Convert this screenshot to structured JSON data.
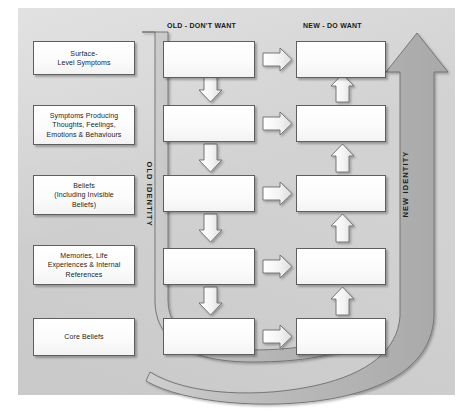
{
  "diagram": {
    "panel_color": "#d2d2d2",
    "box_fill": "#fdfdfd",
    "ribbon_fill": "#bdbdbd",
    "ink": "#1d1d1d"
  },
  "columns": {
    "layers_header": "",
    "old_header": "OLD - DON'T WANT",
    "new_header": "NEW - DO WANT"
  },
  "ribbons": {
    "old_label": "OLD IDENTITY",
    "new_label": "NEW IDENTITY"
  },
  "layers": [
    {
      "label": "Surface-\nLevel Symptoms"
    },
    {
      "label": "Symptoms Producing\nThoughts, Feelings,\nEmotions & Behaviours"
    },
    {
      "label": "Beliefs\n(Including Invisible\nBeliefs)"
    },
    {
      "label": "Memories, Life\nExperiences & Internal\nReferences"
    },
    {
      "label": "Core Beliefs"
    }
  ],
  "old_boxes": [
    {
      "label": ""
    },
    {
      "label": ""
    },
    {
      "label": ""
    },
    {
      "label": ""
    },
    {
      "label": ""
    }
  ],
  "new_boxes": [
    {
      "label": ""
    },
    {
      "label": ""
    },
    {
      "label": ""
    },
    {
      "label": ""
    },
    {
      "label": ""
    }
  ],
  "connectors": {
    "old_down_arrows": 4,
    "new_up_arrows": 4,
    "cross_arrows": 5,
    "cross_arrow_direction": "old-to-new"
  }
}
